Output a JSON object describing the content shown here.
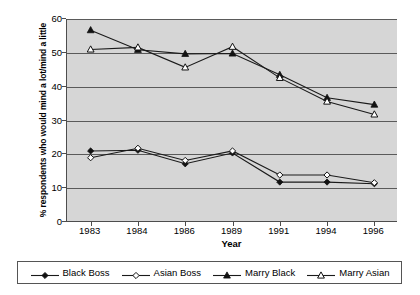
{
  "chart_data": {
    "type": "line",
    "title": "",
    "xlabel": "Year",
    "ylabel": "% respondents who would mind a lot/mind a little",
    "categories": [
      "1983",
      "1984",
      "1986",
      "1989",
      "1991",
      "1994",
      "1996"
    ],
    "ylim": [
      0,
      60
    ],
    "yticks": [
      0,
      10,
      20,
      30,
      40,
      50,
      60
    ],
    "grid": true,
    "legend_position": "bottom",
    "series": [
      {
        "name": "Black Boss",
        "marker": "filled-diamond",
        "values": [
          21.0,
          21.2,
          17.2,
          20.4,
          11.8,
          11.8,
          11.3
        ]
      },
      {
        "name": "Asian Boss",
        "marker": "open-diamond",
        "values": [
          19.0,
          21.8,
          18.2,
          21.0,
          13.9,
          13.9,
          11.6
        ]
      },
      {
        "name": "Marry Black",
        "marker": "filled-triangle",
        "values": [
          56.7,
          50.9,
          49.7,
          49.8,
          43.5,
          36.7,
          34.7
        ]
      },
      {
        "name": "Marry Asian",
        "marker": "open-triangle",
        "values": [
          51.0,
          51.6,
          45.7,
          51.8,
          42.6,
          35.6,
          31.8
        ]
      }
    ]
  },
  "colors": {
    "plot_background": "#d6d6d6",
    "gridline": "#5a5a5a",
    "axis": "#4d4d4d",
    "series_stroke": "#111111",
    "page_background": "#ffffff",
    "legend_border": "#555555"
  }
}
